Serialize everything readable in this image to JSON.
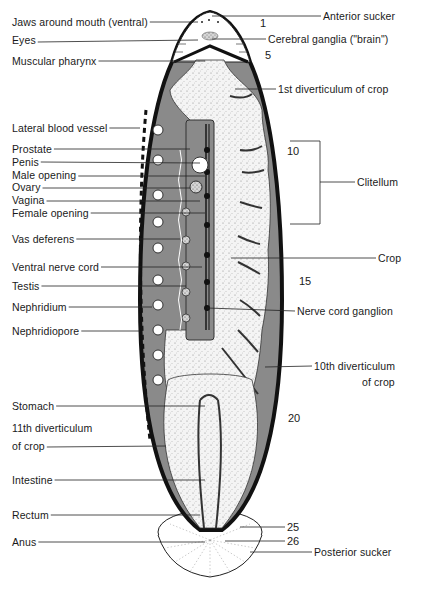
{
  "figure": {
    "left_labels": [
      {
        "id": "jaws",
        "text": "Jaws around mouth (ventral)",
        "x": 12,
        "y": 16,
        "line_to": [
          198,
          22
        ]
      },
      {
        "id": "eyes",
        "text": "Eyes",
        "x": 12,
        "y": 36,
        "line_to": [
          198,
          40
        ]
      },
      {
        "id": "muscular-pharynx",
        "text": "Muscular pharynx",
        "x": 12,
        "y": 55,
        "line_to": [
          205,
          61
        ]
      },
      {
        "id": "lateral-blood-vessel",
        "text": "Lateral blood vessel",
        "x": 12,
        "y": 122,
        "line_to": [
          140,
          128
        ]
      },
      {
        "id": "prostate",
        "text": "Prostate",
        "x": 12,
        "y": 143,
        "line_to": [
          190,
          149
        ]
      },
      {
        "id": "penis",
        "text": "Penis",
        "x": 12,
        "y": 156,
        "line_to": [
          200,
          163
        ]
      },
      {
        "id": "male-opening",
        "text": "Male opening",
        "x": 12,
        "y": 170,
        "line_to": [
          205,
          176
        ]
      },
      {
        "id": "ovary",
        "text": "Ovary",
        "x": 12,
        "y": 182,
        "line_to": [
          190,
          188
        ]
      },
      {
        "id": "vagina",
        "text": "Vagina",
        "x": 12,
        "y": 195,
        "line_to": [
          200,
          201
        ]
      },
      {
        "id": "female-opening",
        "text": "Female opening",
        "x": 12,
        "y": 207,
        "line_to": [
          205,
          213
        ]
      },
      {
        "id": "vas-deferens",
        "text": "Vas deferens",
        "x": 12,
        "y": 233,
        "line_to": [
          180,
          239
        ]
      },
      {
        "id": "ventral-nerve-cord",
        "text": "Ventral nerve cord",
        "x": 12,
        "y": 261,
        "line_to": [
          202,
          267
        ]
      },
      {
        "id": "testis",
        "text": "Testis",
        "x": 12,
        "y": 280,
        "line_to": [
          186,
          286
        ]
      },
      {
        "id": "nephridium",
        "text": "Nephridium",
        "x": 12,
        "y": 301,
        "line_to": [
          152,
          307
        ]
      },
      {
        "id": "nephridiopore",
        "text": "Nephridiopore",
        "x": 12,
        "y": 325,
        "line_to": [
          140,
          331
        ]
      },
      {
        "id": "stomach",
        "text": "Stomach",
        "x": 12,
        "y": 400,
        "line_to": [
          205,
          406
        ]
      },
      {
        "id": "11th-diverticulum",
        "text": "11th diverticulum",
        "x": 12,
        "y": 422,
        "line_to": null
      },
      {
        "id": "11th-diverticulum-2",
        "text": "of crop",
        "x": 12,
        "y": 441,
        "line_to": [
          166,
          446
        ]
      },
      {
        "id": "intestine",
        "text": "Intestine",
        "x": 12,
        "y": 474,
        "line_to": [
          205,
          480
        ]
      },
      {
        "id": "rectum",
        "text": "Rectum",
        "x": 12,
        "y": 509,
        "line_to": [
          200,
          515
        ]
      },
      {
        "id": "anus",
        "text": "Anus",
        "x": 12,
        "y": 536,
        "line_to": [
          205,
          542
        ]
      }
    ],
    "right_labels": [
      {
        "id": "anterior-sucker",
        "text": "Anterior sucker",
        "x": 323,
        "y": 10,
        "line_from": [
          212,
          16
        ]
      },
      {
        "id": "cerebral-ganglia",
        "text": "Cerebral ganglia (\"brain\")",
        "x": 268,
        "y": 33,
        "line_from": [
          212,
          39
        ]
      },
      {
        "id": "1st-diverticulum",
        "text": "1st diverticulum of crop",
        "x": 278,
        "y": 83,
        "line_from": [
          235,
          89
        ]
      },
      {
        "id": "clitellum",
        "text": "Clitellum",
        "x": 357,
        "y": 176,
        "line_from": [
          320,
          182
        ]
      },
      {
        "id": "crop",
        "text": "Crop",
        "x": 378,
        "y": 252,
        "line_from": [
          231,
          258
        ]
      },
      {
        "id": "nerve-cord-ganglion",
        "text": "Nerve cord ganglion",
        "x": 297,
        "y": 305,
        "line_from": [
          207,
          308
        ]
      },
      {
        "id": "10th-diverticulum",
        "text": "10th diverticulum",
        "x": 314,
        "y": 360,
        "line_from": [
          265,
          367
        ]
      },
      {
        "id": "10th-diverticulum-2",
        "text": "of crop",
        "x": 362,
        "y": 376,
        "line_from": null
      },
      {
        "id": "posterior-sucker",
        "text": "Posterior sucker",
        "x": 314,
        "y": 546,
        "line_from": [
          250,
          552
        ]
      }
    ],
    "segment_numbers": [
      {
        "text": "1",
        "x": 260,
        "y": 17
      },
      {
        "text": "5",
        "x": 265,
        "y": 49
      },
      {
        "text": "10",
        "x": 287,
        "y": 145
      },
      {
        "text": "15",
        "x": 299,
        "y": 275
      },
      {
        "text": "20",
        "x": 288,
        "y": 412
      },
      {
        "text": "25",
        "x": 287,
        "y": 521
      },
      {
        "text": "26",
        "x": 287,
        "y": 535
      }
    ],
    "clitellum_bracket": {
      "x1": 290,
      "x2": 320,
      "y_top": 141,
      "y_bottom": 224
    },
    "colors": {
      "ink": "#1a1a1a",
      "body_wall": "#111111",
      "coelom_gray": "#8a8a8a",
      "stipple_fill": "#ececec",
      "background": "#ffffff"
    }
  }
}
